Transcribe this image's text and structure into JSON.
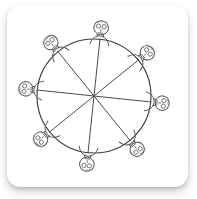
{
  "card": {
    "title": "Round table seating sketch",
    "background_color": "#ffffff",
    "shadow_color": "#828282",
    "corner_radius_px": 13
  },
  "illustration": {
    "name": "round-table-with-eight-people",
    "style": "pencil line sketch",
    "line_color": "#4a4a4a",
    "fill_color": "#ffffff",
    "table": {
      "shape": "circle",
      "center_x": 94,
      "center_y": 96,
      "radius": 57,
      "sector_count": 8,
      "divider_count": 4,
      "divider_rotation_deg": 6
    },
    "people": {
      "count": 8,
      "seat_radius": 64,
      "figure_parts": [
        "head",
        "left-eye",
        "right-eye",
        "nose",
        "mouth",
        "hair",
        "shoulders"
      ],
      "seats": [
        {
          "label": "seat-1",
          "angle_deg": -84
        },
        {
          "label": "seat-2",
          "angle_deg": -39
        },
        {
          "label": "seat-3",
          "angle_deg": 6
        },
        {
          "label": "seat-4",
          "angle_deg": 51
        },
        {
          "label": "seat-5",
          "angle_deg": 96
        },
        {
          "label": "seat-6",
          "angle_deg": 141
        },
        {
          "label": "seat-7",
          "angle_deg": 186
        },
        {
          "label": "seat-8",
          "angle_deg": 231
        }
      ]
    }
  }
}
